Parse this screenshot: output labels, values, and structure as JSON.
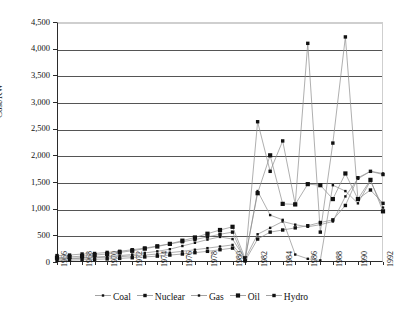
{
  "chart_data": {
    "type": "line",
    "title": "",
    "xlabel": "",
    "ylabel": "Cost/KW",
    "ylim": [
      0,
      4500
    ],
    "ytick_step": 500,
    "ytick_labels": [
      "0",
      "500",
      "1,000",
      "1,500",
      "2,000",
      "2,500",
      "3,000",
      "3,500",
      "4,000",
      "4,500"
    ],
    "grid": true,
    "legend_position": "bottom",
    "x": [
      1966,
      1967,
      1968,
      1969,
      1970,
      1971,
      1972,
      1973,
      1974,
      1975,
      1976,
      1977,
      1978,
      1979,
      1980,
      1981,
      1982,
      1983,
      1984,
      1985,
      1986,
      1987,
      1988,
      1989,
      1990,
      1991,
      1992
    ],
    "xtick_labels": [
      "1966",
      "1968",
      "1970",
      "1972",
      "1974",
      "1976",
      "1978",
      "1980",
      "1982",
      "1984",
      "1986",
      "1988",
      "1990",
      "1992"
    ],
    "xtick_label_years": [
      1966,
      1968,
      1970,
      1972,
      1974,
      1976,
      1978,
      1980,
      1982,
      1984,
      1986,
      1988,
      1990,
      1992
    ],
    "marker_colors": {
      "line": "#8c8c8c",
      "marker": "#111111"
    },
    "series": [
      {
        "name": "Coal",
        "marker": "square-small",
        "values": [
          60,
          70,
          80,
          95,
          105,
          120,
          140,
          170,
          200,
          240,
          300,
          360,
          420,
          470,
          430,
          60,
          520,
          640,
          760,
          700,
          660,
          700,
          760,
          1230,
          1560,
          1700,
          1660
        ]
      },
      {
        "name": "Nuclear",
        "marker": "square",
        "values": [
          120,
          130,
          150,
          160,
          180,
          200,
          230,
          260,
          300,
          340,
          380,
          420,
          470,
          520,
          560,
          30,
          2630,
          1700,
          2270,
          1080,
          4100,
          560,
          2230,
          4220,
          1180,
          1350,
          1100
        ]
      },
      {
        "name": "Gas",
        "marker": "square-small",
        "values": [
          55,
          60,
          70,
          80,
          90,
          100,
          115,
          130,
          150,
          175,
          200,
          230,
          260,
          290,
          320,
          40,
          1330,
          880,
          790,
          140,
          60,
          30,
          1440,
          1330,
          1100,
          1520,
          1020
        ]
      },
      {
        "name": "Oil",
        "marker": "square-large",
        "values": [
          80,
          95,
          110,
          130,
          150,
          180,
          210,
          250,
          290,
          340,
          400,
          460,
          530,
          600,
          660,
          70,
          1290,
          2000,
          1090,
          1080,
          1460,
          1440,
          1180,
          1660,
          1180,
          1540,
          950
        ]
      },
      {
        "name": "Hydro",
        "marker": "square",
        "values": [
          30,
          35,
          42,
          50,
          58,
          68,
          80,
          95,
          110,
          130,
          150,
          175,
          200,
          230,
          260,
          20,
          430,
          560,
          600,
          640,
          680,
          740,
          790,
          1060,
          1580,
          1700,
          1640
        ]
      }
    ]
  }
}
